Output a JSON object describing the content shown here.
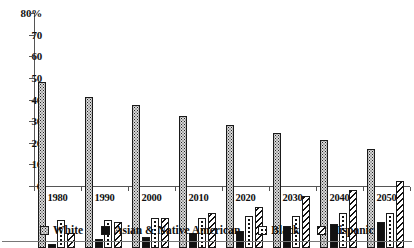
{
  "chart_data": {
    "type": "bar",
    "title": "",
    "subtitle": "",
    "xlabel": "",
    "ylabel": "",
    "ylim": [
      0,
      80
    ],
    "yticks": [
      0,
      10,
      20,
      30,
      40,
      50,
      60,
      70,
      80
    ],
    "ytick_labels": [
      "0",
      "10",
      "20",
      "30",
      "40",
      "50",
      "60",
      "70",
      "80%"
    ],
    "y_unit": "%",
    "grid": false,
    "legend_position": "bottom",
    "categories": [
      "1980",
      "1990",
      "2000",
      "2010",
      "2020",
      "2030",
      "2040",
      "2050"
    ],
    "series": [
      {
        "name": "White",
        "pattern": "fine-dotted",
        "color": "#d8d8d8",
        "values": [
          77,
          70,
          66,
          61,
          57,
          53,
          50,
          46
        ]
      },
      {
        "name": "Asian & Native American",
        "pattern": "solid-black",
        "color": "#111111",
        "values": [
          2,
          4,
          5,
          7,
          8,
          10,
          11,
          12
        ]
      },
      {
        "name": "Black",
        "pattern": "coarse-dotted",
        "color": "#ffffff",
        "values": [
          13,
          13,
          14,
          14,
          15,
          15,
          16,
          16
        ]
      },
      {
        "name": "Hispanic",
        "pattern": "diagonal-stripes",
        "color": "#ffffff",
        "values": [
          7,
          12,
          14,
          16,
          19,
          24,
          27,
          31
        ]
      }
    ]
  }
}
